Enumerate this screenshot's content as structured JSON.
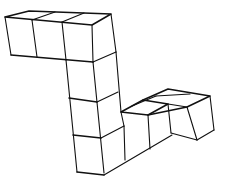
{
  "figure": {
    "type": "isometric-cube-structure",
    "cube_count": 10,
    "colors": {
      "stroke": "#111111",
      "background": "#ffffff"
    },
    "segments": {
      "top_row_cubes": 3,
      "vertical_column_cubes": 3,
      "bottom_row_cubes": 2,
      "end_branch_cubes": 2
    }
  }
}
